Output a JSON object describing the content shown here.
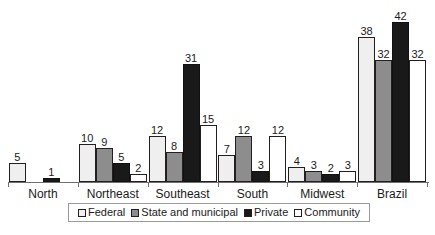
{
  "chart_data": {
    "type": "bar",
    "title": "",
    "subtitle": "",
    "xlabel": "",
    "ylabel": "",
    "grid": false,
    "legend_position": "bottom",
    "axis_range": [
      0,
      42
    ],
    "bar_value_labels": true,
    "categories": [
      "North",
      "Northeast",
      "Southeast",
      "South",
      "Midwest",
      "Brazil"
    ],
    "series": [
      {
        "name": "Federal",
        "color": "#efefef",
        "values": [
          5,
          10,
          12,
          7,
          4,
          38
        ]
      },
      {
        "name": "State and municipal",
        "color": "#8d8d8d",
        "values": [
          null,
          9,
          8,
          12,
          3,
          32
        ]
      },
      {
        "name": "Private",
        "color": "#191919",
        "values": [
          1,
          5,
          31,
          3,
          2,
          42
        ]
      },
      {
        "name": "Community",
        "color": "#ffffff",
        "values": [
          null,
          2,
          15,
          12,
          3,
          32
        ]
      }
    ]
  },
  "legend": {
    "items": [
      {
        "label": "Federal"
      },
      {
        "label": "State and municipal"
      },
      {
        "label": "Private"
      },
      {
        "label": "Community"
      }
    ]
  },
  "colors": {
    "federal": "#efefef",
    "state_and_municipal": "#8d8d8d",
    "private": "#191919",
    "community": "#ffffff",
    "axis": "#6f6f6f",
    "outline": "#231f20",
    "text": "#1a1a1a",
    "background": "#ffffff"
  }
}
